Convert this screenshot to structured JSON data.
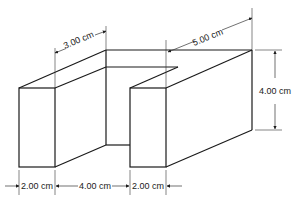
{
  "figure": {
    "type": "isometric-block-with-slot",
    "colors": {
      "line": "#1a1a1a",
      "background": "#ffffff"
    }
  },
  "dimensions": {
    "top_depth_left": "3.00 cm",
    "top_depth_right": "5.00 cm",
    "height": "4.00 cm",
    "bottom_left_width": "2.00 cm",
    "bottom_gap_width": "4.00 cm",
    "bottom_right_width": "2.00 cm"
  }
}
